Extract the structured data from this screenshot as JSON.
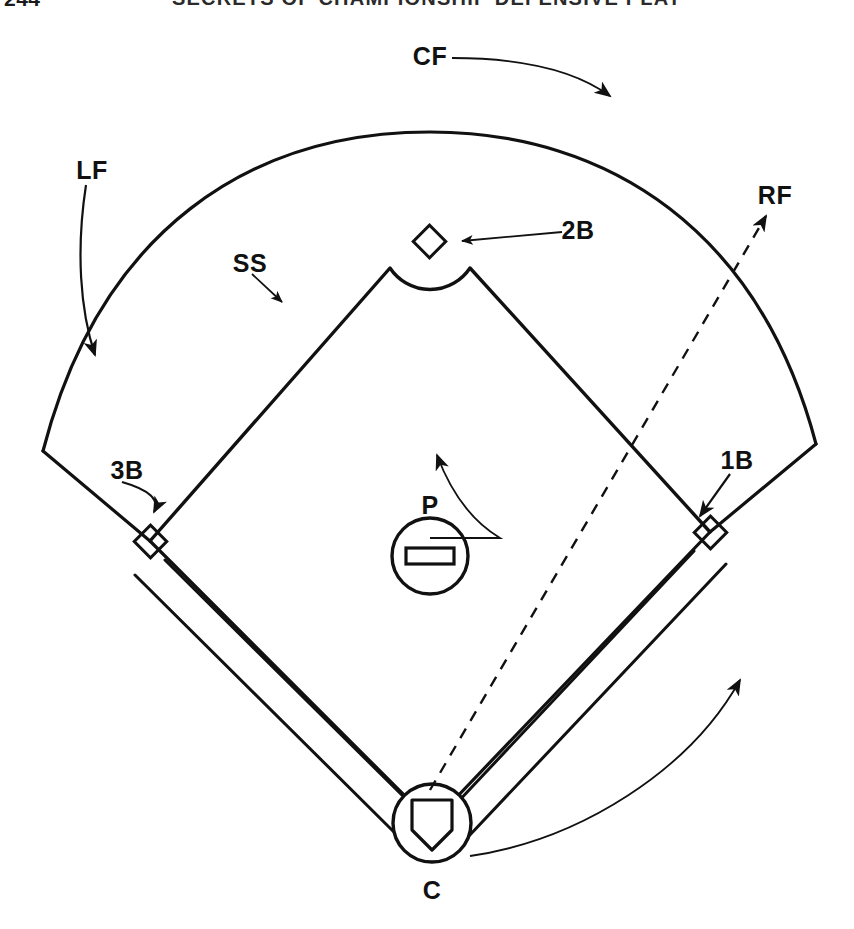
{
  "page": {
    "folio": "244",
    "running_title": "SECRETS OF CHAMPIONSHIP DEFENSIVE PLAY",
    "background_color": "#ffffff",
    "ink_color": "#111111"
  },
  "diagram": {
    "positions": [
      {
        "code": "CF",
        "name": "center-fielder",
        "label_x": 430,
        "label_y": 58
      },
      {
        "code": "LF",
        "name": "left-fielder",
        "label_x": 92,
        "label_y": 172
      },
      {
        "code": "RF",
        "name": "right-fielder",
        "label_x": 775,
        "label_y": 197
      },
      {
        "code": "SS",
        "name": "shortstop",
        "label_x": 250,
        "label_y": 265
      },
      {
        "code": "2B",
        "name": "second-base",
        "label_x": 578,
        "label_y": 232
      },
      {
        "code": "3B",
        "name": "third-base",
        "label_x": 127,
        "label_y": 472
      },
      {
        "code": "1B",
        "name": "first-base",
        "label_x": 737,
        "label_y": 462
      },
      {
        "code": "P",
        "name": "pitcher",
        "label_x": 430,
        "label_y": 507
      },
      {
        "code": "C",
        "name": "catcher",
        "label_x": 432,
        "label_y": 892
      }
    ],
    "bases": [
      {
        "name": "second-base-bag",
        "x": 429,
        "y": 241
      },
      {
        "name": "third-base-bag",
        "x": 150,
        "y": 541
      },
      {
        "name": "first-base-bag",
        "x": 710,
        "y": 532
      }
    ],
    "pitcher_mound": {
      "cx": 430,
      "cy": 556,
      "r": 38,
      "rubber_w": 48,
      "rubber_h": 16
    },
    "home_plate_circle": {
      "cx": 432,
      "cy": 823,
      "r": 39
    },
    "arrows": [
      {
        "name": "cf-arrow",
        "style": "curved-solid",
        "label": "CF"
      },
      {
        "name": "lf-arrow",
        "style": "curved-solid",
        "label": "LF"
      },
      {
        "name": "rf-arrow",
        "style": "dashed",
        "label": "RF"
      },
      {
        "name": "ss-arrow",
        "style": "straight-solid",
        "label": "SS"
      },
      {
        "name": "second-base-arrow",
        "style": "straight-solid",
        "label": "2B"
      },
      {
        "name": "third-base-arrow",
        "style": "curved-solid",
        "label": "3B"
      },
      {
        "name": "first-base-arrow",
        "style": "straight-solid",
        "label": "1B"
      },
      {
        "name": "pitcher-arrow",
        "style": "curved-solid",
        "label": "P"
      },
      {
        "name": "catcher-arrow",
        "style": "curved-solid",
        "label": "C"
      }
    ]
  }
}
